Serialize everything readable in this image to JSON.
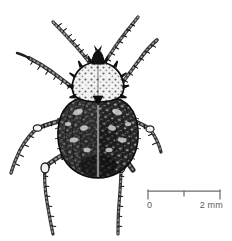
{
  "figure": {
    "style": "black-and-white stipple engraving",
    "background_color": "#ffffff",
    "ink_color": "#1a1a1a"
  },
  "scale_bar": {
    "left_label": "0",
    "right_label": "2 mm",
    "unit": "mm",
    "total_length_value": 2,
    "tick_count": 3,
    "ticks": [
      "0",
      "1",
      "2"
    ],
    "line_color": "#6b6b6b"
  },
  "anatomy": {
    "antenna_left": "left-antenna",
    "antenna_right": "right-antenna",
    "head": "head",
    "pronotum": "pronotum",
    "elytra_left": "left-elytron",
    "elytra_right": "right-elytron",
    "suture": "elytral-suture",
    "legs": [
      "front-left-leg",
      "front-right-leg",
      "middle-left-leg",
      "middle-right-leg",
      "hind-left-leg",
      "hind-right-leg"
    ]
  }
}
